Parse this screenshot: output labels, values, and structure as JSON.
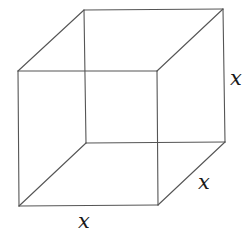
{
  "diagram": {
    "type": "cube",
    "vertices": {
      "front_top_left": [
        18,
        71
      ],
      "front_top_right": [
        157,
        71
      ],
      "front_bottom_left": [
        19,
        206
      ],
      "front_bottom_right": [
        158,
        205
      ],
      "back_top_left": [
        84,
        10
      ],
      "back_top_right": [
        223,
        9
      ],
      "back_bottom_left": [
        86,
        143
      ],
      "back_bottom_right": [
        225,
        142
      ]
    },
    "labels": {
      "height": "x",
      "depth": "x",
      "width": "x"
    },
    "colors": {
      "edge": "#555555",
      "label": "#1a1a1a",
      "background": "#ffffff"
    }
  }
}
